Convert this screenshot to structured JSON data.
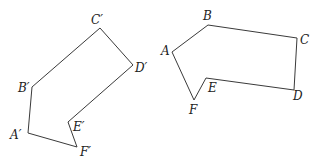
{
  "figure": {
    "stroke_color": "#3a3a3a",
    "label_color": "#222222",
    "image_hexagon": {
      "name": "A'B'C'D'E'F'",
      "points": "28,133 32,87 100,28 133,65 68,122 77,147",
      "labels": {
        "A": "A′",
        "B": "B′",
        "C": "C′",
        "D": "D′",
        "E": "E′",
        "F": "F′"
      }
    },
    "original_hexagon": {
      "name": "ABCDEF",
      "points": "172,52 208,25 297,38 294,90 206,78 194,100",
      "labels": {
        "A": "A",
        "B": "B",
        "C": "C",
        "D": "D",
        "E": "E",
        "F": "F"
      }
    }
  }
}
